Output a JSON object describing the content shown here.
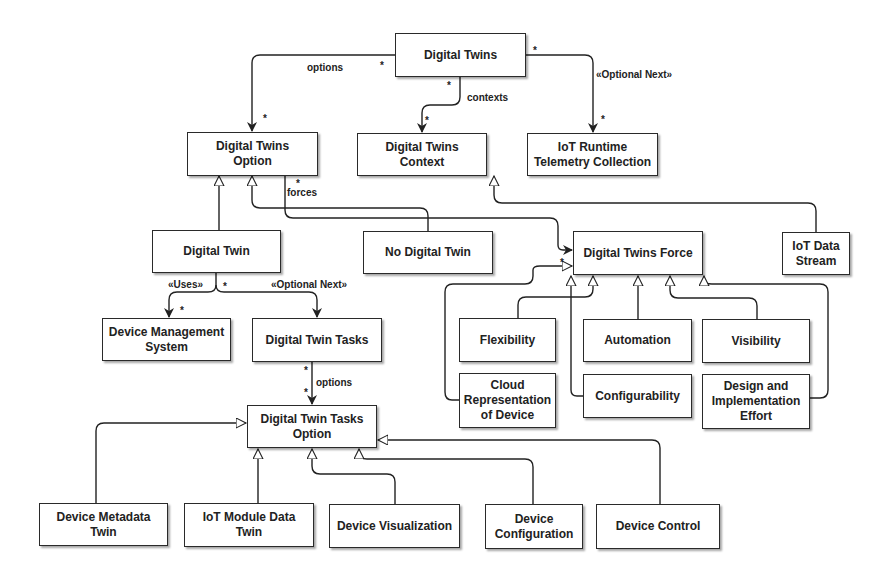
{
  "diagram": {
    "nodes": {
      "digital_twins": "Digital Twins",
      "dt_option": "Digital Twins\nOption",
      "dt_context": "Digital Twins\nContext",
      "iot_runtime": "IoT Runtime\nTelemetry Collection",
      "digital_twin": "Digital Twin",
      "no_digital_twin": "No Digital Twin",
      "dt_force": "Digital Twins Force",
      "iot_data_stream": "IoT Data\nStream",
      "device_mgmt": "Device Management\nSystem",
      "dt_tasks": "Digital Twin Tasks",
      "flexibility": "Flexibility",
      "automation": "Automation",
      "visibility": "Visibility",
      "cloud_rep": "Cloud\nRepresentation\nof Device",
      "configurability": "Configurability",
      "design_effort": "Design and\nImplementation\nEffort",
      "dt_tasks_option": "Digital Twin Tasks\nOption",
      "device_metadata": "Device Metadata\nTwin",
      "iot_module": "IoT Module Data\nTwin",
      "device_vis": "Device Visualization",
      "device_config": "Device\nConfiguration",
      "device_control": "Device Control"
    },
    "edge_labels": {
      "options_top": "options",
      "contexts": "contexts",
      "optional_next_top": "«Optional Next»",
      "forces": "forces",
      "uses": "«Uses»",
      "optional_next_mid": "«Optional Next»",
      "options_bottom": "options"
    },
    "multiplicity": "*"
  }
}
